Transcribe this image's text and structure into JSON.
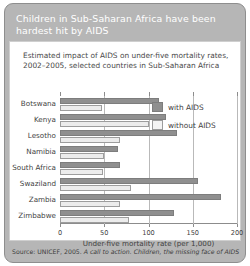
{
  "headline": "Children in Sub-Saharan Africa have been hardest hit by AIDS",
  "source": {
    "prefix": "Source: UNICEF, 2005.",
    "italic": "A call to action. Children, the missing face of AIDS"
  },
  "legend": {
    "with_label": "with AIDS",
    "without_label": "without AIDS"
  },
  "colors": {
    "panel": "#b6b6b6",
    "with_aids": "#8f8f8f",
    "without_aids": "#ececec",
    "axis": "#8c8c8c",
    "grid": "#b9b9b9"
  },
  "chart_data": {
    "type": "bar",
    "orientation": "horizontal",
    "title": "Estimated impact of AIDS on under-five mortality rates, 2002–2005, selected countries in Sub-Saharan Africa",
    "xlabel": "Under-five mortality rate (per 1,000)",
    "ylabel": "",
    "xlim": [
      0,
      200
    ],
    "xticks": [
      0,
      50,
      100,
      150,
      200
    ],
    "xticklabels": [
      "0",
      "50",
      "100",
      "150",
      "200"
    ],
    "grid": true,
    "legend_position": "right",
    "categories": [
      "Botswana",
      "Kenya",
      "Lesotho",
      "Namibia",
      "South Africa",
      "Swaziland",
      "Zambia",
      "Zimbabwe"
    ],
    "series": [
      {
        "name": "with AIDS",
        "values": [
          112,
          120,
          132,
          65,
          68,
          156,
          182,
          129
        ]
      },
      {
        "name": "without AIDS",
        "values": [
          48,
          100,
          68,
          50,
          49,
          80,
          68,
          78
        ]
      }
    ]
  }
}
